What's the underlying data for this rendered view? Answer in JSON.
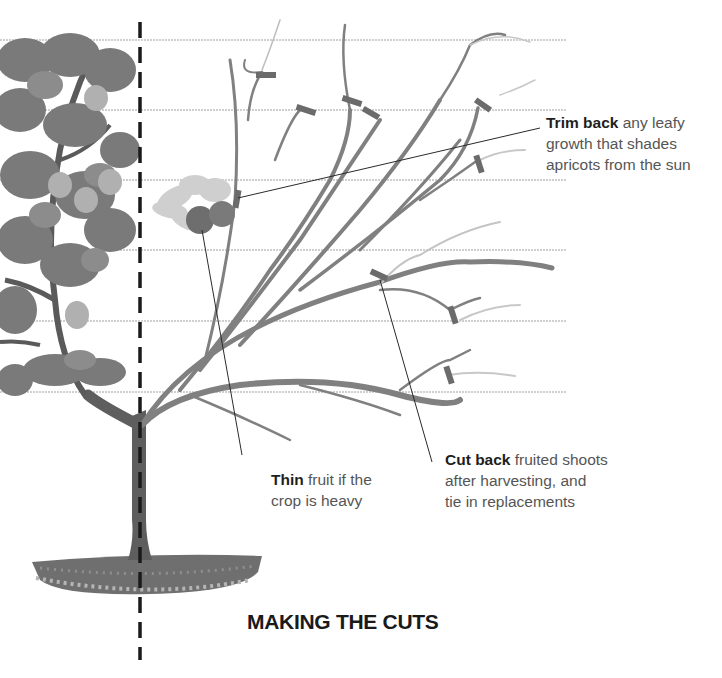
{
  "diagram": {
    "title": "MAKING THE CUTS",
    "colors": {
      "background": "#ffffff",
      "wire": "#9a9a9a",
      "branch": "#7a7a7a",
      "branch_light": "#c4c4c4",
      "cut_mark": "#6b6b6b",
      "leaf_dark": "#6e6e6e",
      "leaf_mid": "#888888",
      "fruit": "#a8a8a8",
      "divider": "#1a1a1a",
      "text": "#555555",
      "text_bold": "#1e1e1e"
    },
    "annotations": [
      {
        "id": "trim-back",
        "bold": "Trim back",
        "lines": [
          " any leafy",
          "growth that shades",
          "apricots from the sun"
        ]
      },
      {
        "id": "thin",
        "bold": "Thin",
        "lines": [
          " fruit if the",
          "crop is heavy"
        ]
      },
      {
        "id": "cut-back",
        "bold": "Cut back",
        "lines": [
          " fruited shoots",
          "after harvesting, and",
          "tie in replacements"
        ]
      }
    ],
    "panels": {
      "left": "tree in leaf (before pruning)",
      "right": "pruned fan framework with cut marks"
    }
  }
}
